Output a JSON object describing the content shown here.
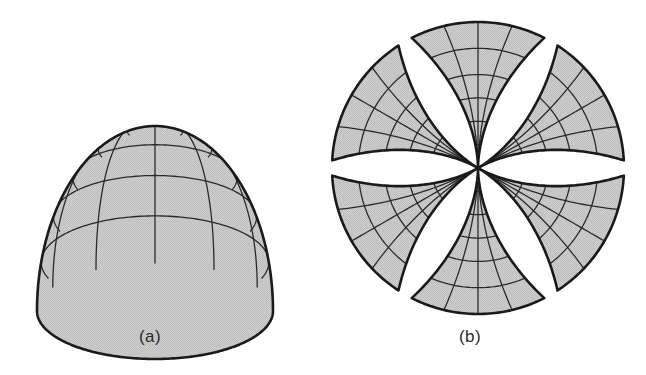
{
  "figure": {
    "width": 646,
    "height": 375,
    "background_color": "#ffffff",
    "outline_color": "#1a1a1a",
    "grid_line_color": "#2a2a2a",
    "fill_color": "#c9c9c9",
    "caption_color": "#2b2b2b"
  },
  "panels": [
    {
      "id": "a",
      "caption": "(a)",
      "subject": "shaded hemisphere with graticule",
      "center_x": 155,
      "base_y": 311,
      "radius_x": 118,
      "radius_y": 48,
      "apex_y": 126,
      "meridian_count": 6,
      "parallel_count": 5,
      "outline_width": 2.6,
      "grid_width": 1.3
    },
    {
      "id": "b",
      "caption": "(b)",
      "subject": "six-gore interrupted polyconic rosette",
      "center_x": 478,
      "center_y": 168,
      "petal_count": 6,
      "petal_half_angle_deg": 27,
      "petal_length": 146,
      "band_count": 6,
      "arc_count": 5,
      "radial_line_count": 3,
      "start_angle_deg": -90,
      "outline_width": 2.6,
      "grid_width": 1.3
    }
  ],
  "captions": {
    "panel_a": "(a)",
    "panel_b": "(b)"
  },
  "chart_data": {
    "type": "diagram",
    "title": "",
    "panels": [
      "(a)",
      "(b)"
    ],
    "hemisphere": {
      "meridians": 6,
      "parallels": 5,
      "parallel_fractions": [
        0.17,
        0.34,
        0.51,
        0.68,
        0.85
      ]
    },
    "gores": {
      "count": 6,
      "angular_width_deg": 60,
      "drawn_half_angle_deg": 27,
      "arc_radii_fractions": [
        0.16,
        0.32,
        0.48,
        0.64,
        0.82,
        1.0
      ],
      "bands_per_gore": 6
    }
  }
}
